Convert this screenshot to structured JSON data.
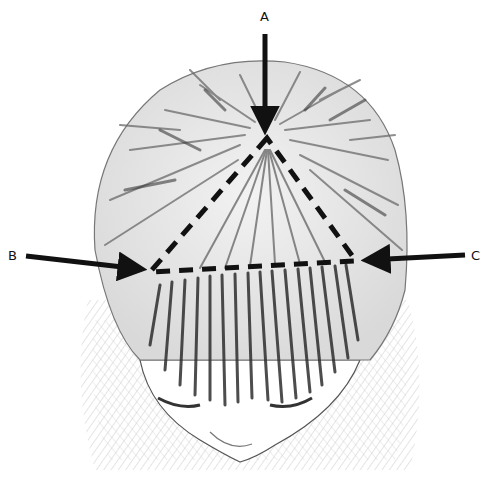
{
  "figure": {
    "labels": {
      "a": "A",
      "b": "B",
      "c": "C"
    },
    "triangle": {
      "vertex_a": [
        267,
        138
      ],
      "vertex_b": [
        150,
        272
      ],
      "vertex_c": [
        356,
        261
      ],
      "line_style": "dashed",
      "color": "#111111"
    },
    "arrows": [
      {
        "label": "A",
        "from": [
          265,
          34
        ],
        "to": [
          265,
          134
        ],
        "direction": "down"
      },
      {
        "label": "B",
        "from": [
          26,
          256
        ],
        "to": [
          146,
          270
        ],
        "direction": "right"
      },
      {
        "label": "C",
        "from": [
          465,
          255
        ],
        "to": [
          360,
          261
        ],
        "direction": "left"
      }
    ],
    "colors": {
      "ink": "#111111",
      "hair_dark": "#3a3a3a",
      "hair_mid": "#8a8a8a",
      "shading": "#c8c8c8",
      "background": "#ffffff"
    }
  }
}
